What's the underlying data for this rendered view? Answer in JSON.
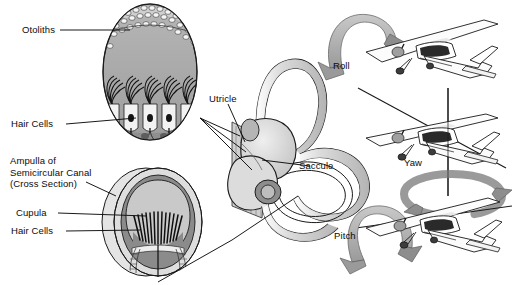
{
  "figure": {
    "background_color": "#ffffff",
    "palette": {
      "outline": "#1a1a1a",
      "mid_gray": "#a8a8a8",
      "dark_gray": "#6f6f6f",
      "light_gray": "#d9d9d9",
      "pale_gray": "#ededed",
      "arrow_gray": "#b4b4b4",
      "arrow_shade": "#8d8d8d",
      "text": "#0b0b0b"
    }
  },
  "labels": {
    "otoliths": "Otoliths",
    "hair_cells_upper": "Hair Cells",
    "ampulla": "Ampulla of\nSemicircular Canal\n(Cross Section)",
    "cupula": "Cupula",
    "hair_cells_lower": "Hair Cells",
    "utricle": "Utricle",
    "saccule": "Saccule",
    "roll": "Roll",
    "yaw": "Yaw",
    "pitch": "Pitch"
  },
  "panels": {
    "otolith_organ": {
      "name": "Otolith organ detail (macula)",
      "parts": [
        "otoliths",
        "otolithic membrane",
        "hair cell bundles",
        "supporting cells",
        "nerve fibers"
      ],
      "otolith_count": 34,
      "hair_bundle_count": 5
    },
    "ampulla_cross_section": {
      "name": "Ampulla of semicircular canal, cross section",
      "parts": [
        "canal wall",
        "endolymph space",
        "cupula",
        "crista ampullaris",
        "hair cells",
        "nerve"
      ],
      "hair_cell_count": 13
    },
    "inner_ear": {
      "name": "Membranous labyrinth",
      "parts": [
        "anterior semicircular canal",
        "posterior semicircular canal",
        "horizontal semicircular canal",
        "utricle",
        "saccule",
        "ampullae"
      ]
    },
    "aircraft": {
      "count": 3,
      "axes": [
        {
          "label_key": "roll",
          "axis": "longitudinal",
          "axis_orientation": "horizontal-through-fuselage",
          "arrow": "curved-over-vertical-loop"
        },
        {
          "label_key": "yaw",
          "axis": "vertical",
          "axis_orientation": "vertical-through-center",
          "arrow": "horizontal-ellipse-loop"
        },
        {
          "label_key": "pitch",
          "axis": "lateral",
          "axis_orientation": "horizontal-through-wings",
          "arrow": "curved-over-vertical-loop"
        }
      ],
      "aircraft_type": "high-wing single-engine airplane"
    }
  }
}
